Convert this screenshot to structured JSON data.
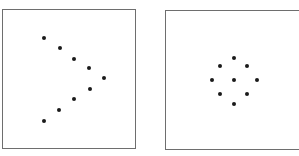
{
  "panels": [
    {
      "id": "chevron-pattern",
      "shape": "arrowhead pointing right",
      "box": {
        "left": 2,
        "top": 9,
        "width": 134,
        "height": 140
      },
      "dot_color": "#1a1a1a",
      "dots": [
        {
          "x": 44,
          "y": 38
        },
        {
          "x": 60,
          "y": 48
        },
        {
          "x": 74,
          "y": 59
        },
        {
          "x": 89,
          "y": 68
        },
        {
          "x": 104,
          "y": 78
        },
        {
          "x": 90,
          "y": 89
        },
        {
          "x": 74,
          "y": 99
        },
        {
          "x": 59,
          "y": 110
        },
        {
          "x": 44,
          "y": 121
        }
      ]
    },
    {
      "id": "diamond-pattern",
      "shape": "diamond ring with center dot",
      "box": {
        "left": 165,
        "top": 10,
        "width": 134,
        "height": 140
      },
      "dot_color": "#1a1a1a",
      "dots": [
        {
          "x": 234,
          "y": 58
        },
        {
          "x": 220,
          "y": 66
        },
        {
          "x": 247,
          "y": 66
        },
        {
          "x": 212,
          "y": 80
        },
        {
          "x": 234,
          "y": 80
        },
        {
          "x": 257,
          "y": 80
        },
        {
          "x": 220,
          "y": 94
        },
        {
          "x": 247,
          "y": 94
        },
        {
          "x": 234,
          "y": 104
        }
      ]
    }
  ]
}
